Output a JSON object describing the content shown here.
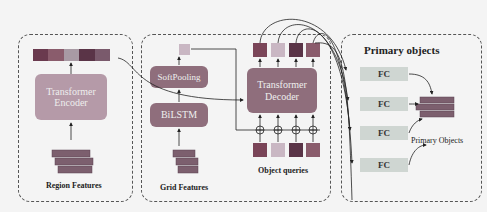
{
  "encoder_panel": {
    "title": "Transformer Encoder",
    "line1": "Transformer",
    "line2": "Encoder",
    "caption": "Region Features",
    "token_colors": [
      "#6a3a4e",
      "#8a5c6c",
      "#a89aa4",
      "#5a3447",
      "#7a5a6c"
    ]
  },
  "grid_panel": {
    "softpooling": "SoftPooling",
    "bilstm": "BiLSTM",
    "caption": "Grid Features",
    "decoder_line1": "Transformer",
    "decoder_line2": "Decoder",
    "queries_caption": "Object queries",
    "output_colors": [
      "#7a4558",
      "#c9b7c3",
      "#5a3447",
      "#8a5c6c"
    ],
    "query_colors": [
      "#7a4558",
      "#c9b7c3",
      "#5a3447",
      "#8a5c6c"
    ]
  },
  "primary_panel": {
    "title": "Primary objects",
    "fc_labels": [
      "FC",
      "FC",
      "FC",
      "FC"
    ],
    "caption": "Primary Objects"
  },
  "colors": {
    "box_fill": "#8f6e7c",
    "encoder_fill": "#b59aa8",
    "feature_block": "#7c5f6e"
  }
}
